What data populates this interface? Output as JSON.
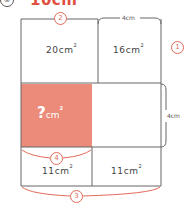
{
  "header": {
    "number": "③",
    "value": "10cm"
  },
  "cells": {
    "top_left": {
      "value": "20cm",
      "sup": "2"
    },
    "top_right": {
      "value": "16cm",
      "sup": "2"
    },
    "middle_left": {
      "value": "?",
      "unit": "cm",
      "sup": "2"
    },
    "bottom_left": {
      "value": "11cm",
      "sup": "2"
    },
    "bottom_right": {
      "value": "11cm",
      "sup": "2"
    }
  },
  "markers": {
    "m1": "1",
    "m2": "2",
    "m3": "3",
    "m4": "4"
  },
  "dimensions": {
    "top_right_width": "4cm",
    "middle_height": "4cm"
  },
  "colors": {
    "highlight": "#ec8b7a",
    "accent": "#e36b5a",
    "line": "#555555"
  }
}
